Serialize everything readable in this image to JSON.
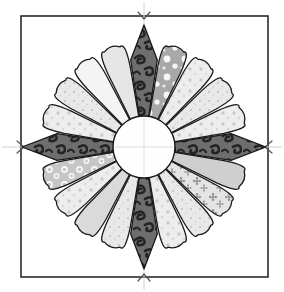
{
  "figure": {
    "kind": "quilt-block-diagram",
    "canvas": {
      "width": 284,
      "height": 292,
      "background": "#ffffff"
    }
  },
  "background_square": {
    "name": "background-square",
    "x": 21,
    "y": 16,
    "width": 247,
    "height": 261,
    "fill": "#ffffff",
    "stroke": "#2b2b2b",
    "stroke_width": 1.6
  },
  "center_guides": {
    "name": "center-guide-lines",
    "stroke": "#cfcfcf",
    "stroke_width": 1,
    "vertical_x": 144,
    "horizontal_y": 147,
    "notch_marks": [
      {
        "name": "notch-top",
        "x": 144,
        "y": 16
      },
      {
        "name": "notch-bottom",
        "x": 144,
        "y": 277
      },
      {
        "name": "notch-left",
        "x": 21,
        "y": 147
      },
      {
        "name": "notch-right",
        "x": 268,
        "y": 147
      }
    ]
  },
  "plate": {
    "center_x": 144,
    "center_y": 147,
    "petal_count": 20,
    "point_petal_count": 4,
    "round_petal_count": 16,
    "inner_radius": 32,
    "round_outer_radius": 103,
    "point_outer_radius": 122,
    "outline_stroke": "#1a1a1a",
    "outline_width": 1.3
  },
  "center_circle": {
    "name": "center-circle",
    "cx": 144,
    "cy": 147,
    "r": 31,
    "fill": "#fefefe",
    "stroke": "#1a1a1a",
    "stroke_width": 1.4
  },
  "palette": {
    "dark_paisley": "#6e6e6e",
    "dark_paisley_motif": "#262626",
    "mid_gray_dot": "#a8a8a8",
    "light_gray": "#d9d9d9",
    "pale_gray": "#e6e6e6",
    "near_white": "#f4f4f4",
    "white": "#fbfbfb",
    "floral_gray": "#9a9a9a",
    "ring_gray": "#b5b5b5"
  },
  "petals": [
    {
      "index": 0,
      "name": "petal-point-top",
      "angle": -90,
      "shape": "point",
      "fill": "#6e6e6e",
      "pattern": "paisley-dark",
      "label": "dark paisley point (top)"
    },
    {
      "index": 1,
      "name": "petal-round-01",
      "angle": -72,
      "shape": "round",
      "fill": "#a8a8a8",
      "pattern": "big-dots",
      "label": "gray with large white dots"
    },
    {
      "index": 2,
      "name": "petal-round-02",
      "angle": -54,
      "shape": "round",
      "fill": "#ededed",
      "pattern": "small-dots",
      "label": "pale with small dots"
    },
    {
      "index": 3,
      "name": "petal-round-03",
      "angle": -36,
      "shape": "round",
      "fill": "#e2e2e2",
      "pattern": "speckle",
      "label": "light speckled"
    },
    {
      "index": 4,
      "name": "petal-round-04",
      "angle": -18,
      "shape": "round",
      "fill": "#e9e9e9",
      "pattern": "small-dots",
      "label": "pale dotted"
    },
    {
      "index": 5,
      "name": "petal-point-right",
      "angle": 0,
      "shape": "point",
      "fill": "#6e6e6e",
      "pattern": "paisley-dark",
      "label": "dark paisley point (right)"
    },
    {
      "index": 6,
      "name": "petal-round-05",
      "angle": 18,
      "shape": "round",
      "fill": "#cfcfcf",
      "pattern": "plain",
      "label": "solid light gray"
    },
    {
      "index": 7,
      "name": "petal-round-06",
      "angle": 36,
      "shape": "round",
      "fill": "#dcdcdc",
      "pattern": "floral",
      "label": "gray floral print"
    },
    {
      "index": 8,
      "name": "petal-round-07",
      "angle": 54,
      "shape": "round",
      "fill": "#f2f2f2",
      "pattern": "speckle",
      "label": "near-white speckled"
    },
    {
      "index": 9,
      "name": "petal-round-08",
      "angle": 72,
      "shape": "round",
      "fill": "#e4e4e4",
      "pattern": "small-dots",
      "label": "pale dotted"
    },
    {
      "index": 10,
      "name": "petal-point-bottom",
      "angle": 90,
      "shape": "point",
      "fill": "#6e6e6e",
      "pattern": "paisley-dark",
      "label": "dark paisley point (bottom)"
    },
    {
      "index": 11,
      "name": "petal-round-09",
      "angle": 108,
      "shape": "round",
      "fill": "#ededed",
      "pattern": "speckle",
      "label": "near-white speckled"
    },
    {
      "index": 12,
      "name": "petal-round-10",
      "angle": 126,
      "shape": "round",
      "fill": "#dadada",
      "pattern": "plain",
      "label": "solid light gray"
    },
    {
      "index": 13,
      "name": "petal-round-11",
      "angle": 144,
      "shape": "round",
      "fill": "#e8e8e8",
      "pattern": "small-dots",
      "label": "pale dotted"
    },
    {
      "index": 14,
      "name": "petal-round-12",
      "angle": 162,
      "shape": "round",
      "fill": "#c6c6c6",
      "pattern": "rings",
      "label": "gray with open rings"
    },
    {
      "index": 15,
      "name": "petal-point-left",
      "angle": 180,
      "shape": "point",
      "fill": "#6e6e6e",
      "pattern": "paisley-dark",
      "label": "dark paisley point (left)"
    },
    {
      "index": 16,
      "name": "petal-round-13",
      "angle": 198,
      "shape": "round",
      "fill": "#efefef",
      "pattern": "small-dots",
      "label": "pale dotted"
    },
    {
      "index": 17,
      "name": "petal-round-14",
      "angle": 216,
      "shape": "round",
      "fill": "#e0e0e0",
      "pattern": "speckle",
      "label": "light speckled"
    },
    {
      "index": 18,
      "name": "petal-round-15",
      "angle": 234,
      "shape": "round",
      "fill": "#f4f4f4",
      "pattern": "plain",
      "label": "white solid"
    },
    {
      "index": 19,
      "name": "petal-round-16",
      "angle": 252,
      "shape": "round",
      "fill": "#e6e6e6",
      "pattern": "plain",
      "label": "pale solid"
    }
  ]
}
